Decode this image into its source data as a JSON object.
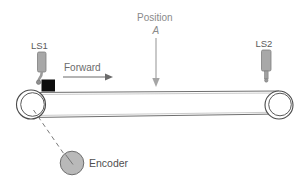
{
  "diagram": {
    "type": "conveyor-belt-schematic",
    "title": "",
    "background_color": "#ffffff",
    "labels": {
      "limit_switch_left": "LS1",
      "limit_switch_right": "LS2",
      "direction": "Forward",
      "position_line1": "Position",
      "position_line2": "A",
      "encoder": "Encoder"
    },
    "colors": {
      "sensor_body": "#a8a8a8",
      "sensor_body_stroke": "#7a7a7a",
      "target_block": "#0d0d0d",
      "encoder_fill": "#b9b9b9",
      "encoder_stroke": "#6e6e6e",
      "belt_stroke": "#6b6b6b",
      "pulley_stroke": "#4a4a4a",
      "arrow_forward": "#6b6b6b",
      "arrow_position": "#9a9a9a",
      "dashed_link": "#7a7a7a",
      "text_gray": "#6e6e6e",
      "text_light_gray": "#8a8a8a"
    },
    "elements": [
      {
        "name": "limit-switch-ls1",
        "label": "LS1",
        "x": 40,
        "y": 64
      },
      {
        "name": "limit-switch-ls2",
        "label": "LS2",
        "x": 265,
        "y": 62
      },
      {
        "name": "target-block",
        "x": 43,
        "y": 85
      },
      {
        "name": "forward-arrow",
        "from_x": 63,
        "to_x": 112,
        "y": 77
      },
      {
        "name": "position-arrow",
        "x": 156,
        "from_y": 37,
        "to_y": 86
      },
      {
        "name": "pulley-left",
        "cx": 31,
        "cy": 104,
        "r": 15
      },
      {
        "name": "pulley-right",
        "cx": 279,
        "cy": 105,
        "r": 14
      },
      {
        "name": "encoder-wheel",
        "cx": 72,
        "cy": 163,
        "r": 12
      },
      {
        "name": "encoder-link",
        "from_x": 33,
        "from_y": 110,
        "to_x": 64,
        "to_y": 154
      }
    ]
  }
}
